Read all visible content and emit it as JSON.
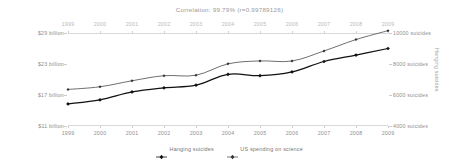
{
  "chart_data": {
    "type": "line",
    "title": "Correlation: 99.79% (r=0.99789126)",
    "x": [
      1999,
      2000,
      2001,
      2002,
      2003,
      2004,
      2005,
      2006,
      2007,
      2008,
      2009
    ],
    "xlabel": "",
    "xtick_labels": [
      "1999",
      "2000",
      "2001",
      "2002",
      "2003",
      "2004",
      "2005",
      "2006",
      "2007",
      "2008",
      "2009"
    ],
    "grid": false,
    "legend_position": "bottom",
    "series": [
      {
        "name": "Hanging suicides",
        "axis": "right",
        "values": [
          5427,
          5688,
          6198,
          6462,
          6635,
          7336,
          7248,
          7491,
          8161,
          8578,
          9000
        ],
        "color": "#111111",
        "marker": "diamond"
      },
      {
        "name": "US spending on science",
        "axis": "left",
        "values": [
          18.079,
          18.594,
          19.753,
          20.734,
          20.831,
          23.029,
          23.597,
          23.584,
          25.525,
          27.731,
          29.449
        ],
        "color": "#555555",
        "marker": "diamond"
      }
    ],
    "left_axis": {
      "label": "US spending on science",
      "tick_labels": [
        "$29 billion",
        "$23 billion",
        "$17 billion",
        "$11 billion"
      ],
      "tick_values": [
        29,
        23,
        17,
        11
      ],
      "ylim": [
        11,
        29
      ]
    },
    "right_axis": {
      "label": "Hanging suicides",
      "tick_labels": [
        "10000 suicides",
        "8000 suicides",
        "6000 suicides",
        "4000 suicides"
      ],
      "tick_values": [
        10000,
        8000,
        6000,
        4000
      ],
      "ylim": [
        4000,
        10000
      ]
    },
    "colors": {
      "series_primary": "#111111",
      "series_secondary": "#555555",
      "axis": "#d9d9d9",
      "text": "#8e8e8e",
      "title": "#9a9a9a"
    }
  }
}
